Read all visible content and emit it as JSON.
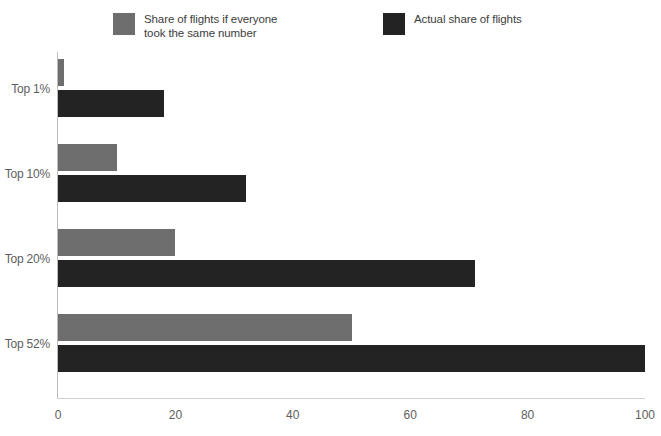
{
  "chart_data": {
    "type": "bar",
    "orientation": "horizontal",
    "title": "",
    "subtitle": "",
    "xlabel": "",
    "ylabel": "",
    "categories": [
      "Top 1%",
      "Top 10%",
      "Top 20%",
      "Top 52%"
    ],
    "series": [
      {
        "name": "Share of flights if everyone\ntook the same number",
        "color": "#6e6e6e",
        "values": [
          1,
          10,
          20,
          50
        ]
      },
      {
        "name": "Actual share of flights",
        "color": "#232323",
        "values": [
          18,
          32,
          71,
          100
        ]
      }
    ],
    "xlim": [
      0,
      100
    ],
    "xticks": [
      0,
      20,
      40,
      60,
      80,
      100
    ],
    "xtick_labels": [
      "0",
      "20",
      "40",
      "60",
      "80",
      "100"
    ],
    "grid": false,
    "legend_position": "top"
  },
  "legend": {
    "items": [
      {
        "label": "Share of flights if everyone\ntook the same number",
        "color": "#6e6e6e"
      },
      {
        "label": "Actual share of flights",
        "color": "#232323"
      }
    ]
  },
  "colors": {
    "series_equal": "#6e6e6e",
    "series_actual": "#232323",
    "axis": "#bdbdbd",
    "text": "#5e5e5e"
  }
}
